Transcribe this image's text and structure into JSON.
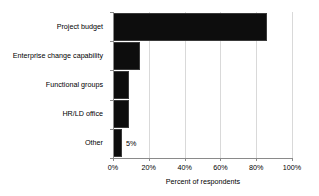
{
  "chart_data": {
    "type": "bar",
    "orientation": "horizontal",
    "title": "",
    "xlabel": "Percent of respondents",
    "ylabel": "",
    "categories": [
      "Project budget",
      "Enterprise change capability",
      "Functional groups",
      "HR/LD office",
      "Other"
    ],
    "values": [
      86,
      15,
      9,
      9,
      5
    ],
    "value_labels": [
      "86%",
      "15%",
      "9%",
      "9%",
      "5%"
    ],
    "label_placement": [
      "inside",
      "inside",
      "inside",
      "inside",
      "outside"
    ],
    "xlim": [
      0,
      100
    ],
    "xticks": [
      0,
      20,
      40,
      60,
      80,
      100
    ],
    "xtick_labels": [
      "0%",
      "20%",
      "40%",
      "60%",
      "80%",
      "100%"
    ],
    "grid": "vertical",
    "legend": "none",
    "bar_color": "#0d0d0d",
    "grid_color": "#d9d9d9",
    "axis_color": "#8a8a8a",
    "background_color": "#ffffff",
    "inside_label_color": "#ffffff",
    "outside_label_color": "#000000"
  }
}
